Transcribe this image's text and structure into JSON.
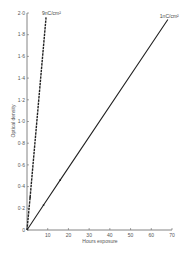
{
  "chart_data": {
    "type": "line",
    "title": "",
    "xlabel": "Hours exposure",
    "ylabel": "Optical density",
    "xlim": [
      0,
      70
    ],
    "ylim": [
      0,
      2.0
    ],
    "x_ticks": [
      "10",
      "20",
      "30",
      "40",
      "50",
      "60",
      "70"
    ],
    "y_ticks": [
      "0",
      "0·2",
      "0·4",
      "0·6",
      "0·8",
      "1·0",
      "1·2",
      "1·4",
      "1·6",
      "1·8",
      "2·0"
    ],
    "grid": false,
    "legend": "inline labels at line ends",
    "series": [
      {
        "name": "9nC/cm²",
        "style": "dashed",
        "x": [
          0,
          1.5,
          9.2
        ],
        "y": [
          0,
          0.3,
          1.96
        ]
      },
      {
        "name": "1nC/cm²",
        "style": "solid",
        "x": [
          0,
          8,
          16,
          68
        ],
        "y": [
          0,
          0.23,
          0.46,
          1.94
        ]
      }
    ]
  },
  "colors": {
    "line": "#222222",
    "axis": "#666666",
    "text": "#555555"
  }
}
